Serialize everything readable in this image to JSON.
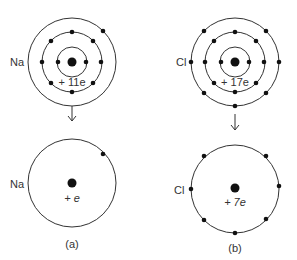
{
  "figure": {
    "panel_a": {
      "caption": "(a)",
      "element": "Na",
      "full_atom": {
        "nucleus_charge": "+ 11e",
        "shells": [
          2,
          8,
          1
        ]
      },
      "simplified": {
        "core_charge": "+ e",
        "valence_electrons": 1
      }
    },
    "panel_b": {
      "caption": "(b)",
      "element": "Cl",
      "full_atom": {
        "nucleus_charge": "+ 17e",
        "shells": [
          2,
          8,
          7
        ]
      },
      "simplified": {
        "core_charge": "+ 7e",
        "valence_electrons": 7
      }
    },
    "arrow_symbol": "↓",
    "colors": {
      "line": "#333333",
      "dot": "#111111",
      "text": "#333333"
    }
  }
}
